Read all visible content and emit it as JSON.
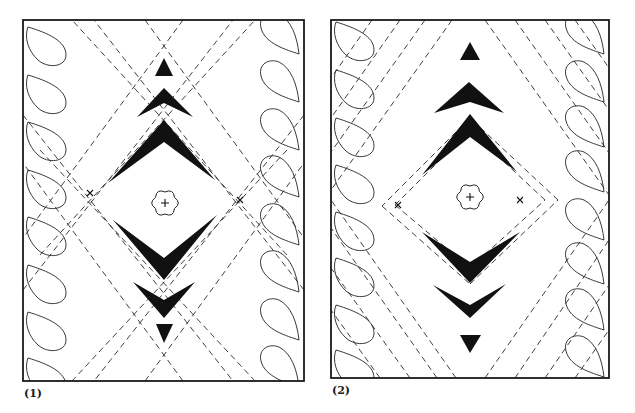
{
  "figure": {
    "width": 635,
    "height": 413,
    "colors": {
      "ink": "#111111",
      "paper": "#ffffff"
    },
    "panels": [
      {
        "id": "panel-1",
        "label": "(1)",
        "label_pos": [
          24,
          388
        ],
        "frame": {
          "x": 23,
          "y": 20,
          "w": 281,
          "h": 361
        },
        "center": [
          164,
          203
        ],
        "flower": {
          "cx": 165,
          "cy": 203,
          "r": 11
        },
        "marks": [
          [
            90,
            193
          ],
          [
            240,
            200
          ]
        ],
        "solids": [
          [
            [
              164,
              58
            ],
            [
              173,
              76
            ],
            [
              155,
              76
            ]
          ],
          [
            [
              164,
              88
            ],
            [
              193,
              117
            ],
            [
              164,
              103
            ],
            [
              137,
              117
            ]
          ],
          [
            [
              164,
              120
            ],
            [
              215,
              180
            ],
            [
              164,
              142
            ],
            [
              108,
              183
            ]
          ],
          [
            [
              113,
              220
            ],
            [
              164,
              258
            ],
            [
              217,
              215
            ],
            [
              164,
              280
            ]
          ],
          [
            [
              133,
              282
            ],
            [
              164,
              300
            ],
            [
              195,
              282
            ],
            [
              164,
              318
            ]
          ],
          [
            [
              156,
              324
            ],
            [
              173,
              324
            ],
            [
              164,
              343
            ]
          ]
        ],
        "dashes": [
          [
            [
              145,
              20
            ],
            [
              304,
              238
            ]
          ],
          [
            [
              183,
              20
            ],
            [
              23,
              238
            ]
          ],
          [
            [
              145,
              381
            ],
            [
              304,
              163
            ]
          ],
          [
            [
              183,
              381
            ],
            [
              23,
              163
            ]
          ],
          [
            [
              23,
              115
            ],
            [
              233,
              381
            ]
          ],
          [
            [
              304,
              115
            ],
            [
              94,
              381
            ]
          ],
          [
            [
              23,
              290
            ],
            [
              233,
              20
            ]
          ],
          [
            [
              304,
              290
            ],
            [
              94,
              20
            ]
          ],
          [
            [
              40,
              150
            ],
            [
              255,
              381
            ]
          ],
          [
            [
              287,
              150
            ],
            [
              72,
              381
            ]
          ],
          [
            [
              40,
              255
            ],
            [
              255,
              20
            ]
          ],
          [
            [
              287,
              255
            ],
            [
              72,
              20
            ]
          ]
        ],
        "paisleys_left": [
          27,
          75,
          122,
          170,
          217,
          265,
          312,
          358
        ],
        "paisleys_right": [
          -8,
          40,
          88,
          135,
          183,
          230,
          278,
          325
        ]
      },
      {
        "id": "panel-2",
        "label": "(2)",
        "label_pos": [
          332,
          385
        ],
        "frame": {
          "x": 331,
          "y": 20,
          "w": 278,
          "h": 358
        },
        "center": [
          470,
          197
        ],
        "flower": {
          "cx": 470,
          "cy": 197,
          "r": 11
        },
        "marks": [
          [
            398,
            205
          ],
          [
            520,
            200
          ]
        ],
        "solids": [
          [
            [
              470,
              42
            ],
            [
              480,
              60
            ],
            [
              460,
              60
            ]
          ],
          [
            [
              469,
              82
            ],
            [
              504,
              113
            ],
            [
              470,
              102
            ],
            [
              434,
              113
            ]
          ],
          [
            [
              470,
              114
            ],
            [
              517,
              172
            ],
            [
              470,
              137
            ],
            [
              422,
              175
            ]
          ],
          [
            [
              422,
              232
            ],
            [
              470,
              262
            ],
            [
              520,
              232
            ],
            [
              470,
              283
            ]
          ],
          [
            [
              433,
              285
            ],
            [
              470,
              305
            ],
            [
              506,
              284
            ],
            [
              470,
              318
            ]
          ],
          [
            [
              460,
              335
            ],
            [
              481,
              335
            ],
            [
              470,
              353
            ]
          ]
        ],
        "dashes": [
          [
            [
              372,
              20
            ],
            [
              331,
              78
            ]
          ],
          [
            [
              400,
              20
            ],
            [
              331,
              118
            ]
          ],
          [
            [
              425,
              20
            ],
            [
              331,
              152
            ]
          ],
          [
            [
              452,
              20
            ],
            [
              331,
              190
            ]
          ],
          [
            [
              485,
              20
            ],
            [
              609,
              195
            ]
          ],
          [
            [
              515,
              20
            ],
            [
              609,
              153
            ]
          ],
          [
            [
              545,
              20
            ],
            [
              609,
              110
            ]
          ],
          [
            [
              575,
              20
            ],
            [
              609,
              68
            ]
          ],
          [
            [
              380,
              378
            ],
            [
              331,
              310
            ]
          ],
          [
            [
              410,
              378
            ],
            [
              331,
              268
            ]
          ],
          [
            [
              437,
              378
            ],
            [
              331,
              228
            ]
          ],
          [
            [
              456,
              378
            ],
            [
              331,
              200
            ]
          ],
          [
            [
              485,
              378
            ],
            [
              609,
              200
            ]
          ],
          [
            [
              515,
              378
            ],
            [
              609,
              240
            ]
          ],
          [
            [
              545,
              378
            ],
            [
              609,
              285
            ]
          ],
          [
            [
              575,
              378
            ],
            [
              609,
              330
            ]
          ],
          [
            [
              470,
              130
            ],
            [
              395,
              205
            ]
          ],
          [
            [
              395,
              205
            ],
            [
              470,
              268
            ]
          ],
          [
            [
              470,
              268
            ],
            [
              545,
              200
            ]
          ],
          [
            [
              545,
              200
            ],
            [
              470,
              130
            ]
          ],
          [
            [
              470,
              118
            ],
            [
              382,
              206
            ]
          ],
          [
            [
              382,
              206
            ],
            [
              470,
              284
            ]
          ],
          [
            [
              470,
              284
            ],
            [
              558,
              200
            ]
          ],
          [
            [
              558,
              200
            ],
            [
              470,
              118
            ]
          ]
        ],
        "paisleys_left": [
          22,
          70,
          118,
          165,
          212,
          258,
          305,
          350
        ],
        "paisleys_right": [
          -8,
          40,
          85,
          130,
          178,
          222,
          268,
          315
        ]
      }
    ]
  }
}
